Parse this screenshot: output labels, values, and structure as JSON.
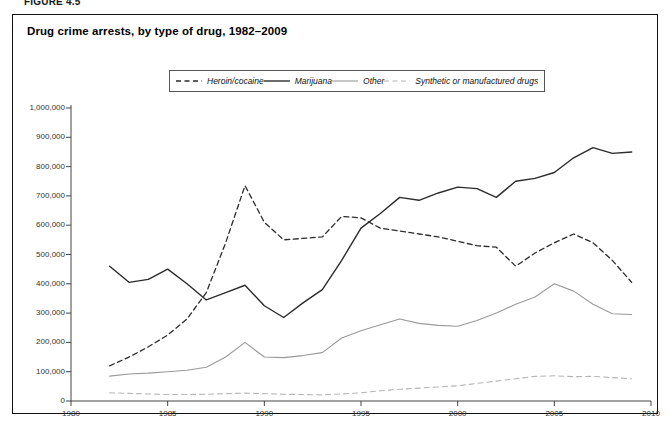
{
  "figure": {
    "label": "FIGURE 4.5",
    "title": "Drug crime arrests, by type of drug, 1982–2009"
  },
  "legend": {
    "position": "top-center",
    "items": [
      {
        "label": "Heroin/cocaine",
        "style": "dashed",
        "color": "#2b2b2b",
        "width": 1.3
      },
      {
        "label": "Marijuana",
        "style": "solid",
        "color": "#2b2b2b",
        "width": 1.4
      },
      {
        "label": "Other",
        "style": "solid",
        "color": "#9a9a9a",
        "width": 1.1
      },
      {
        "label": "Synthetic or manufactured drugs",
        "style": "dashed",
        "color": "#b5b5b5",
        "width": 1.1
      }
    ]
  },
  "axes": {
    "y_ticks": [
      "0",
      "100,000",
      "200,000",
      "300,000",
      "400,000",
      "500,000",
      "600,000",
      "700,000",
      "800,000",
      "900,000",
      "1,000,000"
    ],
    "x_ticks": [
      "1980",
      "1985",
      "1990",
      "1995",
      "2000",
      "2005",
      "2010"
    ]
  },
  "chart_data": {
    "type": "line",
    "title": "Drug crime arrests, by type of drug, 1982–2009",
    "xlabel": "",
    "ylabel": "",
    "xlim": [
      1980,
      2010
    ],
    "ylim": [
      0,
      1000000
    ],
    "grid": false,
    "legend_position": "top-center",
    "x": [
      1982,
      1983,
      1984,
      1985,
      1986,
      1987,
      1988,
      1989,
      1990,
      1991,
      1992,
      1993,
      1994,
      1995,
      1996,
      1997,
      1998,
      1999,
      2000,
      2001,
      2002,
      2003,
      2004,
      2005,
      2006,
      2007,
      2008,
      2009
    ],
    "series": [
      {
        "name": "Heroin/cocaine",
        "style": "dashed",
        "color": "#2b2b2b",
        "values": [
          120000,
          150000,
          185000,
          225000,
          280000,
          370000,
          540000,
          735000,
          610000,
          550000,
          555000,
          560000,
          630000,
          625000,
          590000,
          580000,
          570000,
          560000,
          545000,
          530000,
          525000,
          460000,
          505000,
          540000,
          570000,
          540000,
          480000,
          405000
        ]
      },
      {
        "name": "Marijuana",
        "style": "solid",
        "color": "#2b2b2b",
        "values": [
          460000,
          405000,
          415000,
          450000,
          400000,
          345000,
          370000,
          395000,
          325000,
          285000,
          335000,
          380000,
          480000,
          590000,
          640000,
          695000,
          685000,
          710000,
          730000,
          725000,
          695000,
          750000,
          760000,
          780000,
          830000,
          865000,
          845000,
          850000
        ]
      },
      {
        "name": "Other",
        "style": "solid",
        "color": "#9a9a9a",
        "values": [
          85000,
          92000,
          95000,
          100000,
          105000,
          115000,
          150000,
          200000,
          150000,
          148000,
          155000,
          165000,
          215000,
          240000,
          260000,
          280000,
          265000,
          258000,
          255000,
          275000,
          300000,
          330000,
          355000,
          400000,
          375000,
          330000,
          298000,
          295000
        ]
      },
      {
        "name": "Synthetic or manufactured drugs",
        "style": "dashed",
        "color": "#b5b5b5",
        "values": [
          28000,
          26000,
          24000,
          22000,
          22000,
          23000,
          25000,
          27000,
          25000,
          23000,
          22000,
          21000,
          24000,
          28000,
          35000,
          40000,
          44000,
          48000,
          52000,
          60000,
          68000,
          76000,
          84000,
          86000,
          83000,
          84000,
          80000,
          76000
        ]
      }
    ]
  }
}
